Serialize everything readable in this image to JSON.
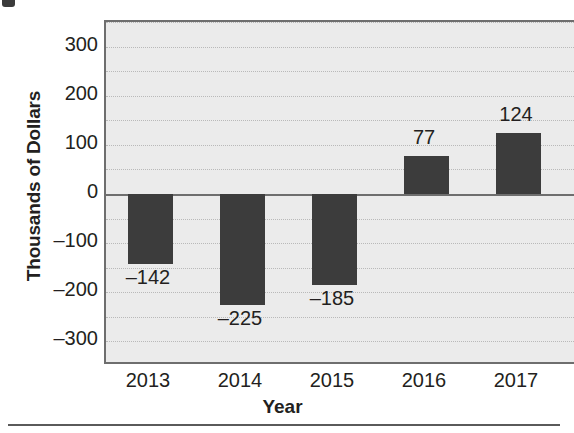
{
  "figure": {
    "fragment_note": "clipped-mark"
  },
  "chart_data": {
    "type": "bar",
    "title": "",
    "subtitle": "",
    "xlabel": "Year",
    "ylabel": "Thousands of Dollars",
    "categories": [
      "2013",
      "2014",
      "2015",
      "2016",
      "2017"
    ],
    "values": [
      -142,
      -225,
      -185,
      77,
      124
    ],
    "data_labels": [
      "–142",
      "–225",
      "–185",
      "77",
      "124"
    ],
    "ylim": [
      -350,
      350
    ],
    "yticks": [
      300,
      200,
      100,
      0,
      -100,
      -200,
      -300
    ],
    "ytick_labels": [
      "300",
      "200",
      "100",
      "0",
      "–100",
      "–200",
      "–300"
    ],
    "gridline_values": [
      350,
      300,
      250,
      200,
      150,
      100,
      50,
      -50,
      -100,
      -150,
      -200,
      -250,
      -300,
      -350
    ],
    "grid": true,
    "grid_style": "dotted",
    "legend": false,
    "legend_position": "none",
    "series": [
      {
        "name": "Net Income",
        "values": [
          -142,
          -225,
          -185,
          77,
          124
        ]
      }
    ],
    "colors": {
      "bar": "#3c3c3c",
      "plot_background": "#ebebeb",
      "gridline": "#b9b9b9",
      "axis": "#6e6e6e",
      "text": "#231f20",
      "page_background": "#ffffff"
    }
  }
}
